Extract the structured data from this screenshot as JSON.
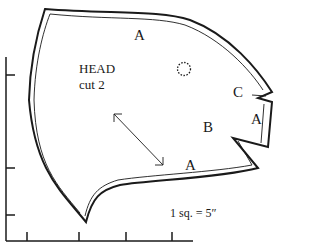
{
  "pattern": {
    "piece_name": "HEAD",
    "cut_instruction": "cut 2",
    "scale_note": "1 sq. = 5″",
    "markers": [
      {
        "id": "A-top",
        "label": "A"
      },
      {
        "id": "C",
        "label": "C"
      },
      {
        "id": "A-right",
        "label": "A"
      },
      {
        "id": "B",
        "label": "B"
      },
      {
        "id": "A-bottom",
        "label": "A"
      }
    ],
    "symbols": [
      "grainline-arrow",
      "eye-placement-circle",
      "grid-ruler"
    ]
  }
}
